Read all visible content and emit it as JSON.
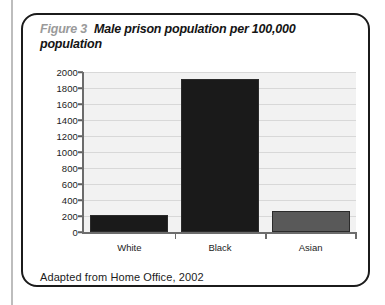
{
  "figure": {
    "number_label": "Figure 3",
    "title": "Male prison population per 100,000 population",
    "source_note": "Adapted from Home Office, 2002"
  },
  "colors": {
    "border": "#1b1b1b",
    "figure_number": "#9a9a9a",
    "plot_background": "#f2f2f2",
    "gridline": "#d8d8d8",
    "axis": "#6c6c6c",
    "bar_dark": "#1a1a1a",
    "bar_gray": "#595959"
  },
  "chart_data": {
    "type": "bar",
    "title": "Male prison population per 100,000 population",
    "xlabel": "",
    "ylabel": "",
    "categories": [
      "White",
      "Black",
      "Asian"
    ],
    "values": [
      215,
      1915,
      265
    ],
    "bar_colors": [
      "#1a1a1a",
      "#1a1a1a",
      "#595959"
    ],
    "ylim": [
      0,
      2000
    ],
    "ytick_values": [
      0,
      200,
      400,
      600,
      800,
      1000,
      1200,
      1400,
      1600,
      1800,
      2000
    ],
    "ytick_labels": [
      "0",
      "200",
      "400",
      "600",
      "800",
      "1000",
      "1200",
      "1400",
      "1600",
      "1800",
      "2000"
    ],
    "grid": true,
    "legend": false,
    "source": "Adapted from Home Office, 2002"
  }
}
